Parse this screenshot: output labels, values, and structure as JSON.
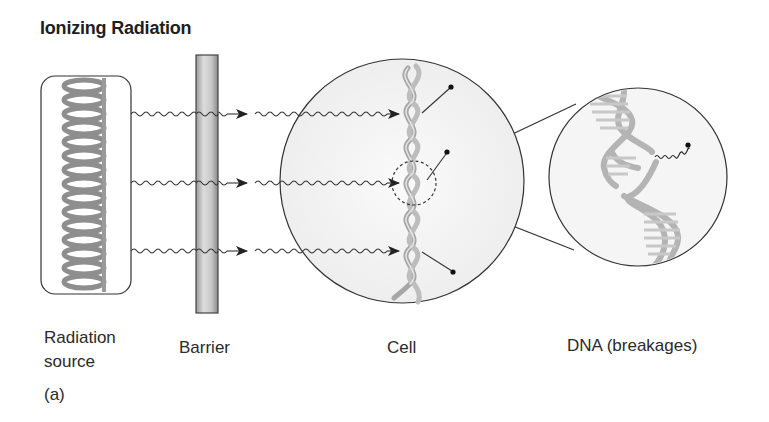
{
  "figure": {
    "title": "Ionizing Radiation",
    "part_label": "(a)"
  },
  "labels": {
    "source_line1": "Radiation",
    "source_line2": "source",
    "barrier": "Barrier",
    "cell": "Cell",
    "dna": "DNA (breakages)"
  },
  "components": [
    {
      "id": "radiation-source",
      "label": "Radiation source",
      "shape": "rounded-rectangle with coiled helix"
    },
    {
      "id": "barrier",
      "label": "Barrier",
      "shape": "vertical gradient bar"
    },
    {
      "id": "cell",
      "label": "Cell",
      "shape": "circle containing DNA strand"
    },
    {
      "id": "dna-zoom",
      "label": "DNA (breakages)",
      "shape": "magnified circle with broken double helix"
    }
  ],
  "connections": [
    {
      "from": "radiation-source",
      "to": "cell",
      "type": "wavy-arrow",
      "count": 3,
      "passes_through": "barrier"
    },
    {
      "from": "cell",
      "to": "dna-zoom",
      "type": "zoom-lines"
    }
  ],
  "colors": {
    "stroke": "#333333",
    "helix": "#9a9a9a",
    "helix_light": "#c4c4c4",
    "cell_fill": "#f3f3f3",
    "barrier_dark": "#8c8c8c",
    "barrier_light": "#e2e2e2"
  }
}
